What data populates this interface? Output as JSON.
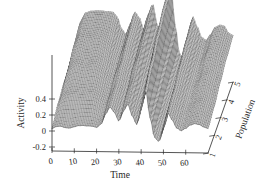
{
  "figure": {
    "kind": "surface-plot",
    "background_color": "#ffffff",
    "line_color": "#3a3a3a",
    "fill_color": "#f2f2f2",
    "axis_color": "#2a2a2a"
  },
  "chart_data": {
    "type": "line",
    "render_as": "3d-wireframe-surface",
    "title": "",
    "subtitle": "",
    "xlabel": "Time",
    "ylabel": "Population",
    "zlabel": "Activity",
    "grid": false,
    "legend": null,
    "legend_position": "none",
    "x_axis": {
      "label": "Time",
      "ticks": [
        0,
        10,
        20,
        30,
        40,
        50,
        60
      ],
      "tick_labels": [
        "0",
        "10",
        "20",
        "30",
        "40",
        "50",
        "60"
      ],
      "lim": [
        0,
        70
      ]
    },
    "y_axis": {
      "label": "Population",
      "ticks": [
        1,
        2,
        3,
        4,
        5
      ],
      "tick_labels": [
        "1",
        "2",
        "3",
        "4",
        "5"
      ],
      "lim": [
        1,
        5
      ]
    },
    "z_axis": {
      "label": "Activity",
      "ticks": [
        -0.2,
        0,
        0.2,
        0.4
      ],
      "tick_labels": [
        "-0.2",
        "0",
        "0.2",
        "0.4"
      ],
      "lim": [
        -0.25,
        0.95
      ]
    },
    "series": [
      {
        "name": "Population 1",
        "x": [
          0,
          2,
          4,
          6,
          8,
          10,
          12,
          14,
          16,
          18,
          20,
          22,
          24,
          26,
          28,
          30,
          32,
          34,
          36,
          38,
          40,
          42,
          44,
          46,
          48,
          50,
          52,
          54,
          56,
          58,
          60,
          62,
          64,
          66,
          68,
          70
        ],
        "values": [
          0.03,
          0.05,
          0.06,
          0.05,
          0.04,
          0.05,
          0.07,
          0.08,
          0.07,
          0.06,
          0.05,
          0.1,
          0.22,
          0.3,
          0.24,
          0.14,
          0.26,
          0.34,
          0.2,
          0.1,
          0.3,
          0.52,
          0.18,
          -0.06,
          -0.11,
          0.04,
          0.24,
          0.16,
          0.06,
          0.02,
          0.05,
          0.1,
          0.12,
          0.1,
          0.07,
          0.06
        ]
      },
      {
        "name": "Population 2",
        "x": [
          0,
          2,
          4,
          6,
          8,
          10,
          12,
          14,
          16,
          18,
          20,
          22,
          24,
          26,
          28,
          30,
          32,
          34,
          36,
          38,
          40,
          42,
          44,
          46,
          48,
          50,
          52,
          54,
          56,
          58,
          60,
          62,
          64,
          66,
          68,
          70
        ],
        "values": [
          0.12,
          0.22,
          0.26,
          0.27,
          0.26,
          0.26,
          0.27,
          0.27,
          0.26,
          0.24,
          0.18,
          0.16,
          0.26,
          0.36,
          0.3,
          0.2,
          0.34,
          0.44,
          0.26,
          0.16,
          0.42,
          0.66,
          0.26,
          -0.02,
          -0.08,
          0.1,
          0.32,
          0.24,
          0.12,
          0.08,
          0.12,
          0.18,
          0.2,
          0.18,
          0.14,
          0.12
        ]
      },
      {
        "name": "Population 3",
        "x": [
          0,
          2,
          4,
          6,
          8,
          10,
          12,
          14,
          16,
          18,
          20,
          22,
          24,
          26,
          28,
          30,
          32,
          34,
          36,
          38,
          40,
          42,
          44,
          46,
          48,
          50,
          52,
          54,
          56,
          58,
          60,
          62,
          64,
          66,
          68,
          70
        ],
        "values": [
          0.18,
          0.34,
          0.4,
          0.42,
          0.41,
          0.41,
          0.42,
          0.42,
          0.4,
          0.36,
          0.26,
          0.22,
          0.34,
          0.46,
          0.4,
          0.28,
          0.44,
          0.56,
          0.34,
          0.22,
          0.56,
          0.82,
          0.34,
          0.02,
          -0.04,
          0.16,
          0.42,
          0.32,
          0.18,
          0.14,
          0.2,
          0.28,
          0.3,
          0.28,
          0.22,
          0.2
        ]
      },
      {
        "name": "Population 4",
        "x": [
          0,
          2,
          4,
          6,
          8,
          10,
          12,
          14,
          16,
          18,
          20,
          22,
          24,
          26,
          28,
          30,
          32,
          34,
          36,
          38,
          40,
          42,
          44,
          46,
          48,
          50,
          52,
          54,
          56,
          58,
          60,
          62,
          64,
          66,
          68,
          70
        ],
        "values": [
          0.22,
          0.44,
          0.52,
          0.54,
          0.53,
          0.53,
          0.54,
          0.54,
          0.52,
          0.46,
          0.34,
          0.28,
          0.4,
          0.54,
          0.48,
          0.34,
          0.52,
          0.64,
          0.4,
          0.26,
          0.66,
          0.92,
          0.4,
          0.06,
          0.0,
          0.22,
          0.5,
          0.38,
          0.24,
          0.2,
          0.28,
          0.38,
          0.4,
          0.38,
          0.3,
          0.28
        ]
      },
      {
        "name": "Population 5",
        "x": [
          0,
          2,
          4,
          6,
          8,
          10,
          12,
          14,
          16,
          18,
          20,
          22,
          24,
          26,
          28,
          30,
          32,
          34,
          36,
          38,
          40,
          42,
          44,
          46,
          48,
          50,
          52,
          54,
          56,
          58,
          60,
          62,
          64,
          66,
          68,
          70
        ],
        "values": [
          0.26,
          0.5,
          0.6,
          0.62,
          0.61,
          0.61,
          0.62,
          0.62,
          0.6,
          0.54,
          0.4,
          0.34,
          0.46,
          0.6,
          0.54,
          0.4,
          0.58,
          0.7,
          0.46,
          0.32,
          0.74,
          0.98,
          0.46,
          0.1,
          0.04,
          0.28,
          0.56,
          0.44,
          0.3,
          0.26,
          0.34,
          0.44,
          0.46,
          0.44,
          0.36,
          0.34
        ]
      }
    ]
  }
}
